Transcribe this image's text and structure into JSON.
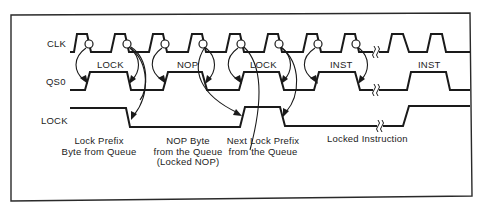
{
  "signals": {
    "clk": "CLK",
    "qs0": "QS0",
    "lock": "LOCK"
  },
  "bus_labels": {
    "lock": "LOCK",
    "nop": "NOP",
    "lock2": "LOCK",
    "inst": "INST",
    "inst2": "INST"
  },
  "captions": {
    "lock_prefix": {
      "line1": "Lock Prefix",
      "line2": "Byte from Queue"
    },
    "nop_byte": {
      "line1": "NOP Byte",
      "line2": "from the Queue",
      "line3": "(Locked NOP)"
    },
    "next_lock_prefix": {
      "line1": "Next Lock Prefix",
      "line2": "from the Queue"
    },
    "locked_instruction": {
      "line1": "Locked Instruction"
    }
  },
  "colors": {
    "ink": "#1a1a1a",
    "background": "#ffffff"
  }
}
